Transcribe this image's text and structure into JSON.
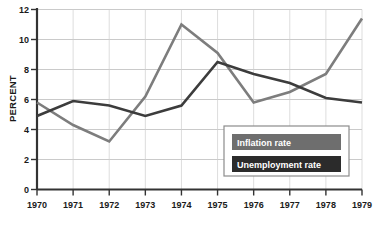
{
  "chart_data": {
    "type": "line",
    "title": "",
    "xlabel": "",
    "ylabel": "PERCENT",
    "x": [
      1970,
      1971,
      1972,
      1973,
      1974,
      1975,
      1976,
      1977,
      1978,
      1979
    ],
    "xticklabels": [
      "1970",
      "1971",
      "1972",
      "1973",
      "1974",
      "1975",
      "1976",
      "1977",
      "1978",
      "1979"
    ],
    "yticklabels": [
      "0",
      "2",
      "4",
      "6",
      "8",
      "10",
      "12"
    ],
    "yticks": [
      0,
      2,
      4,
      6,
      8,
      10,
      12
    ],
    "ylim": [
      0,
      12
    ],
    "xlim": [
      1970,
      1979
    ],
    "grid": true,
    "legend_position": "inside-lower-right",
    "series": [
      {
        "name": "Inflation rate",
        "color": "#7d7d7d",
        "values": [
          5.8,
          4.3,
          3.2,
          6.2,
          11.0,
          9.1,
          5.8,
          6.5,
          7.7,
          11.4
        ]
      },
      {
        "name": "Unemployment rate",
        "color": "#3c3c3c",
        "values": [
          4.9,
          5.9,
          5.6,
          4.9,
          5.6,
          8.5,
          7.7,
          7.1,
          6.1,
          5.8
        ]
      }
    ]
  },
  "legend": {
    "items": [
      {
        "label": "Inflation rate",
        "swatch_color": "#6e6e6e"
      },
      {
        "label": "Unemployment rate",
        "swatch_color": "#2b2b2b"
      }
    ]
  },
  "axes": {
    "y_title": "PERCENT"
  }
}
